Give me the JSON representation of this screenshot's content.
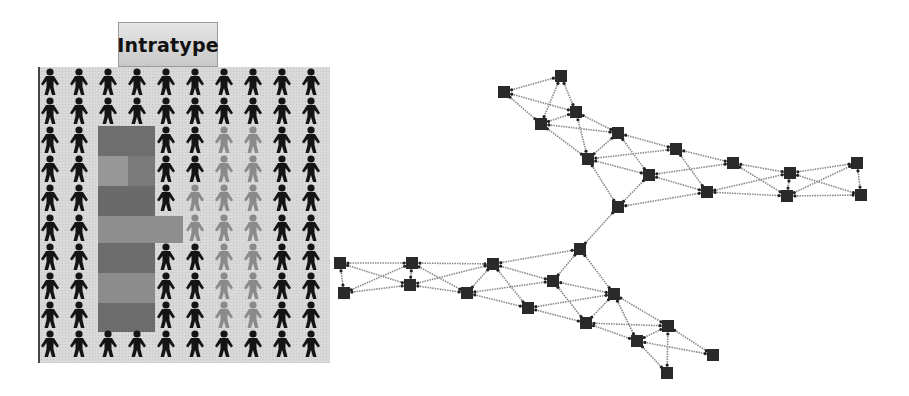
{
  "title": "Intratype",
  "grid": {
    "columns": 10,
    "rows": 10,
    "col_x": [
      50,
      79,
      108,
      137,
      166,
      195,
      224,
      253,
      282,
      311
    ],
    "row_y": [
      82,
      111,
      140,
      169,
      198,
      228,
      257,
      286,
      315,
      344
    ],
    "colors": {
      "dark": "#141414",
      "light": "#8a8a8a",
      "background": "#d9d9d9"
    },
    "light_figures": [
      [
        2,
        6
      ],
      [
        2,
        7
      ],
      [
        3,
        6
      ],
      [
        3,
        7
      ],
      [
        4,
        5
      ],
      [
        4,
        6
      ],
      [
        4,
        7
      ],
      [
        5,
        6
      ],
      [
        5,
        7
      ],
      [
        6,
        6
      ],
      [
        6,
        7
      ],
      [
        7,
        6
      ],
      [
        7,
        7
      ],
      [
        8,
        6
      ],
      [
        8,
        7
      ],
      [
        5,
        5
      ]
    ],
    "hidden_figures": [
      [
        2,
        2
      ],
      [
        2,
        3
      ],
      [
        3,
        2
      ],
      [
        3,
        3
      ],
      [
        4,
        2
      ],
      [
        4,
        3
      ],
      [
        5,
        2
      ],
      [
        5,
        3
      ],
      [
        5,
        4
      ],
      [
        6,
        2
      ],
      [
        6,
        3
      ],
      [
        7,
        2
      ],
      [
        7,
        3
      ],
      [
        8,
        2
      ],
      [
        8,
        3
      ]
    ],
    "shaded_blocks": [
      {
        "x": 98,
        "y": 126,
        "w": 57,
        "h": 30,
        "color": "#6e6e6e"
      },
      {
        "x": 98,
        "y": 156,
        "w": 57,
        "h": 30,
        "color": "#7a7a7a"
      },
      {
        "x": 98,
        "y": 156,
        "w": 30,
        "h": 30,
        "color": "#979797"
      },
      {
        "x": 98,
        "y": 186,
        "w": 57,
        "h": 30,
        "color": "#6a6a6a"
      },
      {
        "x": 98,
        "y": 216,
        "w": 85,
        "h": 27,
        "color": "#8e8e8e"
      },
      {
        "x": 98,
        "y": 243,
        "w": 57,
        "h": 30,
        "color": "#6c6c6c"
      },
      {
        "x": 98,
        "y": 273,
        "w": 57,
        "h": 30,
        "color": "#8c8c8c"
      },
      {
        "x": 98,
        "y": 303,
        "w": 57,
        "h": 29,
        "color": "#6c6c6c"
      }
    ]
  },
  "network": {
    "node_color": "#2a2a2a",
    "edge_color": "#8a8a8a",
    "nodes": {
      "A1": [
        504,
        92
      ],
      "A2": [
        561,
        76
      ],
      "B1": [
        541,
        124
      ],
      "B2": [
        576,
        112
      ],
      "C1": [
        588,
        159
      ],
      "C2": [
        618,
        133
      ],
      "D1": [
        649,
        175
      ],
      "D2": [
        676,
        149
      ],
      "E1": [
        707,
        192
      ],
      "E2": [
        733,
        163
      ],
      "F1": [
        787,
        196
      ],
      "F2": [
        790,
        173
      ],
      "G1": [
        861,
        195
      ],
      "G2": [
        857,
        163
      ],
      "J1": [
        618,
        207
      ],
      "J2": [
        580,
        249
      ],
      "L1": [
        340,
        263
      ],
      "L2": [
        344,
        293
      ],
      "M1": [
        412,
        263
      ],
      "M2": [
        410,
        285
      ],
      "N1": [
        493,
        264
      ],
      "N2": [
        467,
        293
      ],
      "O1": [
        553,
        281
      ],
      "O2": [
        528,
        308
      ],
      "P1": [
        614,
        294
      ],
      "P2": [
        586,
        323
      ],
      "Q1": [
        668,
        326
      ],
      "Q2": [
        637,
        341
      ],
      "R1": [
        713,
        355
      ],
      "R2": [
        667,
        373
      ]
    },
    "edges": [
      [
        "A1",
        "A2"
      ],
      [
        "A1",
        "B2"
      ],
      [
        "A1",
        "B1"
      ],
      [
        "A2",
        "B2"
      ],
      [
        "A2",
        "B1"
      ],
      [
        "B1",
        "B2"
      ],
      [
        "B1",
        "C2"
      ],
      [
        "B1",
        "C1"
      ],
      [
        "B2",
        "C2"
      ],
      [
        "B2",
        "C1"
      ],
      [
        "C1",
        "D2"
      ],
      [
        "C1",
        "D1"
      ],
      [
        "C2",
        "D2"
      ],
      [
        "C2",
        "D1"
      ],
      [
        "C1",
        "J1"
      ],
      [
        "C2",
        "C1"
      ],
      [
        "D1",
        "E2"
      ],
      [
        "D1",
        "E1"
      ],
      [
        "D2",
        "E2"
      ],
      [
        "D2",
        "E1"
      ],
      [
        "J1",
        "D1"
      ],
      [
        "J1",
        "E1"
      ],
      [
        "E1",
        "F2"
      ],
      [
        "E1",
        "F1"
      ],
      [
        "E2",
        "F2"
      ],
      [
        "E2",
        "F1"
      ],
      [
        "F1",
        "F2"
      ],
      [
        "F2",
        "G2"
      ],
      [
        "F2",
        "G1"
      ],
      [
        "F1",
        "G2"
      ],
      [
        "F1",
        "G1"
      ],
      [
        "G1",
        "G2"
      ],
      [
        "J1",
        "J2"
      ],
      [
        "L1",
        "L2"
      ],
      [
        "L1",
        "M1"
      ],
      [
        "L1",
        "M2"
      ],
      [
        "L2",
        "M1"
      ],
      [
        "L2",
        "M2"
      ],
      [
        "M1",
        "M2"
      ],
      [
        "M1",
        "N1"
      ],
      [
        "M1",
        "N2"
      ],
      [
        "M2",
        "N1"
      ],
      [
        "M2",
        "N2"
      ],
      [
        "N1",
        "O1"
      ],
      [
        "N1",
        "O2"
      ],
      [
        "N2",
        "O1"
      ],
      [
        "N2",
        "O2"
      ],
      [
        "N1",
        "N2"
      ],
      [
        "N1",
        "J2"
      ],
      [
        "J2",
        "O1"
      ],
      [
        "J2",
        "P1"
      ],
      [
        "O1",
        "P1"
      ],
      [
        "O1",
        "P2"
      ],
      [
        "O2",
        "P1"
      ],
      [
        "O2",
        "P2"
      ],
      [
        "P1",
        "Q1"
      ],
      [
        "P1",
        "Q2"
      ],
      [
        "P2",
        "Q1"
      ],
      [
        "P2",
        "Q2"
      ],
      [
        "P1",
        "P2"
      ],
      [
        "Q1",
        "R1"
      ],
      [
        "Q1",
        "R2"
      ],
      [
        "Q2",
        "R1"
      ],
      [
        "Q2",
        "R2"
      ],
      [
        "Q1",
        "Q2"
      ]
    ]
  }
}
